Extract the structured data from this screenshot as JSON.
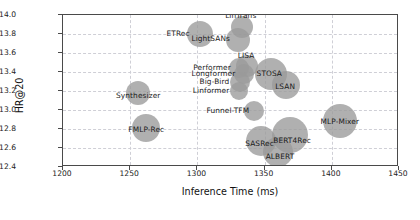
{
  "chart_data": {
    "type": "scatter",
    "title": "",
    "xlabel": "Inference Time (ms)",
    "ylabel": "HR@20",
    "xlim": [
      1200,
      1450
    ],
    "ylim": [
      12.4,
      14.0
    ],
    "xticks": [
      "1200",
      "1250",
      "1300",
      "1350",
      "1400",
      "1450"
    ],
    "yticks": [
      "12.4",
      "12.6",
      "12.8",
      "13.0",
      "13.2",
      "13.4",
      "13.6",
      "13.8",
      "14.0"
    ],
    "grid": true,
    "legend": "none",
    "bubble_encoding": "marker size encodes model parameter scale",
    "bubble_color": "#9a9a9a",
    "points": [
      {
        "label": "ETRec",
        "x": 1302,
        "y": 13.8,
        "size": 13,
        "label_dx": -22,
        "label_dy": -1
      },
      {
        "label": "LinTrans",
        "x": 1333,
        "y": 13.87,
        "size": 11,
        "label_dx": -1,
        "label_dy": -12
      },
      {
        "label": "LightSANs",
        "x": 1330,
        "y": 13.74,
        "size": 12,
        "label_dx": -27,
        "label_dy": -2
      },
      {
        "label": "Performer",
        "x": 1331,
        "y": 13.44,
        "size": 10,
        "label_dx": -27,
        "label_dy": -1
      },
      {
        "label": "LISA",
        "x": 1337,
        "y": 13.46,
        "size": 11,
        "label_dx": -1,
        "label_dy": -11
      },
      {
        "label": "Longformer",
        "x": 1335,
        "y": 13.38,
        "size": 10,
        "label_dx": -31,
        "label_dy": -1
      },
      {
        "label": "Big-Bird",
        "x": 1332,
        "y": 13.3,
        "size": 10,
        "label_dx": -26,
        "label_dy": -1
      },
      {
        "label": "Linformer",
        "x": 1331,
        "y": 13.2,
        "size": 9,
        "label_dx": -28,
        "label_dy": -1
      },
      {
        "label": "STOSA",
        "x": 1355,
        "y": 13.38,
        "size": 16,
        "label_dx": -2,
        "label_dy": -1
      },
      {
        "label": "LSAN",
        "x": 1366,
        "y": 13.26,
        "size": 14,
        "label_dx": -1,
        "label_dy": 1
      },
      {
        "label": "Synthesizer",
        "x": 1256,
        "y": 13.18,
        "size": 12,
        "label_dx": 0,
        "label_dy": 2
      },
      {
        "label": "FMLP-Rec",
        "x": 1262,
        "y": 12.81,
        "size": 14,
        "label_dx": 0,
        "label_dy": 1
      },
      {
        "label": "Funnel-TFM",
        "x": 1342,
        "y": 12.99,
        "size": 10,
        "label_dx": -26,
        "label_dy": -1
      },
      {
        "label": "MLP-Mixer",
        "x": 1406,
        "y": 12.88,
        "size": 17,
        "label_dx": 0,
        "label_dy": 0
      },
      {
        "label": "BERT4Rec",
        "x": 1369,
        "y": 12.74,
        "size": 18,
        "label_dx": 2,
        "label_dy": 5
      },
      {
        "label": "SASRec",
        "x": 1347,
        "y": 12.67,
        "size": 15,
        "label_dx": -1,
        "label_dy": 2
      },
      {
        "label": "ALBERT",
        "x": 1360,
        "y": 12.56,
        "size": 15,
        "label_dx": 2,
        "label_dy": 4
      }
    ]
  }
}
